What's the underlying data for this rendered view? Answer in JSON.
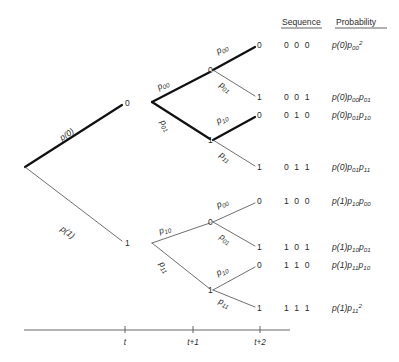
{
  "figure": {
    "type": "probability-tree-diagram"
  },
  "columns": {
    "sequence_header": "Sequence",
    "probability_header": "Probability"
  },
  "root": {
    "label": "",
    "x": 25,
    "y": 167
  },
  "edges": [
    {
      "id": "e-root-0",
      "label_base": "p",
      "label_paren": "(0)",
      "label_sub": "",
      "from": "root",
      "to": "n0",
      "thick": true
    },
    {
      "id": "e-root-1",
      "label_base": "p",
      "label_paren": "(1)",
      "label_sub": "",
      "from": "root",
      "to": "n1",
      "thick": false
    },
    {
      "id": "e-n0-00",
      "label_base": "p",
      "label_paren": "",
      "label_sub": "00",
      "from": "n0",
      "to": "n00",
      "thick": true
    },
    {
      "id": "e-n0-01",
      "label_base": "p",
      "label_paren": "",
      "label_sub": "01",
      "from": "n0",
      "to": "n01",
      "thick": true
    },
    {
      "id": "e-n1-10",
      "label_base": "p",
      "label_paren": "",
      "label_sub": "10",
      "from": "n1",
      "to": "n10",
      "thick": false
    },
    {
      "id": "e-n1-11",
      "label_base": "p",
      "label_paren": "",
      "label_sub": "11",
      "from": "n1",
      "to": "n11",
      "thick": false
    },
    {
      "id": "e-n00-000",
      "label_base": "p",
      "label_paren": "",
      "label_sub": "00",
      "from": "n00",
      "to": "L000",
      "thick": true
    },
    {
      "id": "e-n00-001",
      "label_base": "p",
      "label_paren": "",
      "label_sub": "01",
      "from": "n00",
      "to": "L001",
      "thick": false
    },
    {
      "id": "e-n01-010",
      "label_base": "p",
      "label_paren": "",
      "label_sub": "10",
      "from": "n01",
      "to": "L010",
      "thick": true
    },
    {
      "id": "e-n01-011",
      "label_base": "p",
      "label_paren": "",
      "label_sub": "11",
      "from": "n01",
      "to": "L011",
      "thick": false
    },
    {
      "id": "e-n10-100",
      "label_base": "p",
      "label_paren": "",
      "label_sub": "00",
      "from": "n10",
      "to": "L100",
      "thick": false
    },
    {
      "id": "e-n10-101",
      "label_base": "p",
      "label_paren": "",
      "label_sub": "01",
      "from": "n10",
      "to": "L101",
      "thick": false
    },
    {
      "id": "e-n11-110",
      "label_base": "p",
      "label_paren": "",
      "label_sub": "10",
      "from": "n11",
      "to": "L110",
      "thick": false
    },
    {
      "id": "e-n11-111",
      "label_base": "p",
      "label_paren": "",
      "label_sub": "11",
      "from": "n11",
      "to": "L111",
      "thick": false
    }
  ],
  "nodes": {
    "n0": {
      "label": "0",
      "x": 125,
      "y": 103
    },
    "n1": {
      "label": "1",
      "x": 125,
      "y": 243
    },
    "n00": {
      "label": "0",
      "x": 213,
      "y": 70
    },
    "n01": {
      "label": "1",
      "x": 213,
      "y": 140
    },
    "n10": {
      "label": "0",
      "x": 213,
      "y": 222
    },
    "n11": {
      "label": "1",
      "x": 213,
      "y": 290
    }
  },
  "leaves": [
    {
      "id": "L000",
      "label": "0",
      "x": 258,
      "y": 45,
      "sequence": "0 0 0",
      "prob_base": "p",
      "prob_paren": "(0)",
      "prob_terms": [
        {
          "base": "p",
          "sub": "00",
          "sup": "2"
        }
      ]
    },
    {
      "id": "L001",
      "label": "1",
      "x": 258,
      "y": 97,
      "sequence": "0 0 1",
      "prob_base": "p",
      "prob_paren": "(0)",
      "prob_terms": [
        {
          "base": "p",
          "sub": "00",
          "sup": ""
        },
        {
          "base": "p",
          "sub": "01",
          "sup": ""
        }
      ]
    },
    {
      "id": "L010",
      "label": "0",
      "x": 258,
      "y": 115,
      "sequence": "0 1 0",
      "prob_base": "p",
      "prob_paren": "(0)",
      "prob_terms": [
        {
          "base": "p",
          "sub": "01",
          "sup": ""
        },
        {
          "base": "p",
          "sub": "10",
          "sup": ""
        }
      ]
    },
    {
      "id": "L011",
      "label": "1",
      "x": 258,
      "y": 167,
      "sequence": "0 1 1",
      "prob_base": "p",
      "prob_paren": "(0)",
      "prob_terms": [
        {
          "base": "p",
          "sub": "01",
          "sup": ""
        },
        {
          "base": "p",
          "sub": "11",
          "sup": ""
        }
      ]
    },
    {
      "id": "L100",
      "label": "0",
      "x": 258,
      "y": 201,
      "sequence": "1 0 0",
      "prob_base": "p",
      "prob_paren": "(1)",
      "prob_terms": [
        {
          "base": "p",
          "sub": "10",
          "sup": ""
        },
        {
          "base": "p",
          "sub": "00",
          "sup": ""
        }
      ]
    },
    {
      "id": "L101",
      "label": "1",
      "x": 258,
      "y": 247,
      "sequence": "1 0 1",
      "prob_base": "p",
      "prob_paren": "(1)",
      "prob_terms": [
        {
          "base": "p",
          "sub": "10",
          "sup": ""
        },
        {
          "base": "p",
          "sub": "01",
          "sup": ""
        }
      ]
    },
    {
      "id": "L110",
      "label": "0",
      "x": 258,
      "y": 265,
      "sequence": "1 1 0",
      "prob_base": "p",
      "prob_paren": "(1)",
      "prob_terms": [
        {
          "base": "p",
          "sub": "11",
          "sup": ""
        },
        {
          "base": "p",
          "sub": "10",
          "sup": ""
        }
      ]
    },
    {
      "id": "L111",
      "label": "1",
      "x": 258,
      "y": 308,
      "sequence": "1 1 1",
      "prob_base": "p",
      "prob_paren": "(1)",
      "prob_terms": [
        {
          "base": "p",
          "sub": "11",
          "sup": "2"
        }
      ]
    }
  ],
  "axis": {
    "x_start": 24,
    "x_end": 290,
    "y": 330,
    "ticks": [
      {
        "label": "t",
        "x": 125
      },
      {
        "label": "t+1",
        "x": 193
      },
      {
        "label": "t+2",
        "x": 260
      }
    ]
  },
  "colors": {
    "ink": "#2b2b2b",
    "thick_stroke": "#111111",
    "thin_stroke": "#4a4a4a",
    "axis": "#555555",
    "background": "#ffffff"
  }
}
